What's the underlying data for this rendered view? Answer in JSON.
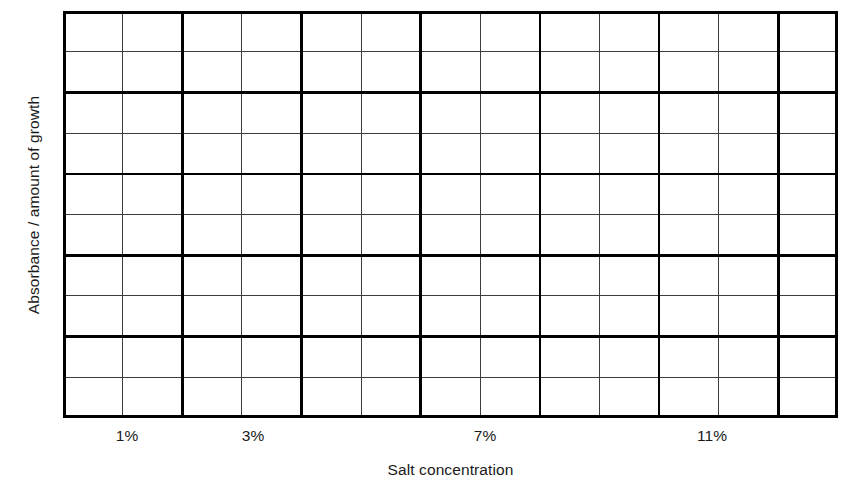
{
  "chart_data": {
    "type": "table",
    "title": "",
    "subtitle": "",
    "xlabel": "Salt concentration",
    "ylabel": "Absorbance / amount of growth",
    "grid": true,
    "legend": null,
    "series": [],
    "categories": [],
    "values": [],
    "x_ticks": [
      {
        "label": "1%",
        "x_px": 127
      },
      {
        "label": "3%",
        "x_px": 253
      },
      {
        "label": "7%",
        "x_px": 485
      },
      {
        "label": "11%",
        "x_px": 712
      }
    ],
    "y_ticks": [],
    "grid_columns": 13,
    "grid_rows": 10,
    "xlim": [
      0,
      13
    ],
    "ylim": [
      0,
      10
    ]
  },
  "axes": {
    "y_title": "Absorbance / amount of growth",
    "x_title": "Salt concentration"
  },
  "style": {
    "major_line_color": "#000000",
    "minor_line_color": "#3d3d3d",
    "background": "#ffffff",
    "text_color": "#1a1a1a",
    "major_line_width": 2.6,
    "minor_line_width": 1.1
  },
  "geometry": {
    "plot_left": 63,
    "plot_top": 11,
    "plot_width": 775,
    "plot_height": 407,
    "col_width": 59.615,
    "row_height": 40.7
  }
}
